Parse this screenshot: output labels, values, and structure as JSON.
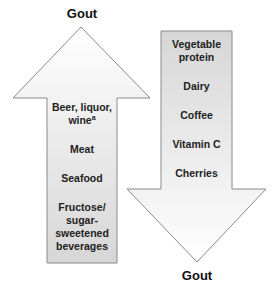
{
  "diagram": {
    "type": "two-arrow risk diagram",
    "increase_arrow": {
      "direction": "up",
      "target_label": "Gout",
      "items": [
        {
          "text": "Beer, liquor, wine",
          "superscript": "a"
        },
        {
          "text": "Meat"
        },
        {
          "text": "Seafood"
        },
        {
          "text": "Fructose/ sugar-sweetened beverages"
        }
      ]
    },
    "decrease_arrow": {
      "direction": "down",
      "target_label": "Gout",
      "items": [
        {
          "text": "Vegetable protein"
        },
        {
          "text": "Dairy"
        },
        {
          "text": "Coffee"
        },
        {
          "text": "Vitamin C"
        },
        {
          "text": "Cherries"
        }
      ]
    },
    "colors": {
      "outline": "#8a8a8a",
      "fill_light": "#ffffff",
      "fill_dark": "#d6d6d6",
      "text": "#1a1a1a"
    }
  }
}
